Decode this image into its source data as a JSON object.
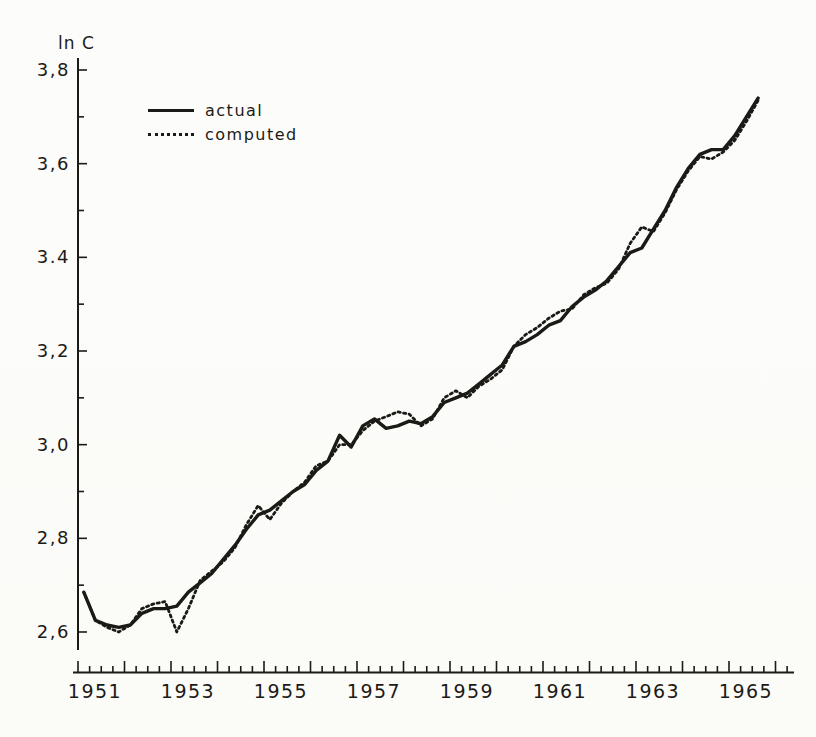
{
  "figure": {
    "background": "#fbfbf8",
    "ink": "#1c1a17"
  },
  "legend": {
    "items": [
      {
        "label": "actual",
        "style": "solid"
      },
      {
        "label": "computed",
        "style": "dotted"
      }
    ]
  },
  "chart_data": {
    "type": "line",
    "title": "",
    "xlabel": "",
    "ylabel": "ln C",
    "grid": false,
    "legend_position": "upper-left-inside",
    "xlim": [
      1950.9,
      1966.4
    ],
    "ylim": [
      2.56,
      3.83
    ],
    "x_start": 1951.125,
    "x_step": 0.25,
    "x_unit": "quarter",
    "x_label_years": [
      1951,
      1953,
      1955,
      1957,
      1959,
      1961,
      1963,
      1965
    ],
    "y_ticks_major": [
      2.6,
      2.8,
      3.0,
      3.2,
      3.4,
      3.6,
      3.8
    ],
    "y_tick_labels": [
      "2,6",
      "2,8",
      "3,0",
      "3,2",
      "3.4",
      "3,6",
      "3,8"
    ],
    "y_minor_step": 0.1,
    "series": [
      {
        "name": "actual",
        "style": "solid",
        "values": [
          2.685,
          2.625,
          2.615,
          2.61,
          2.615,
          2.64,
          2.65,
          2.65,
          2.655,
          2.685,
          2.705,
          2.725,
          2.755,
          2.785,
          2.82,
          2.85,
          2.86,
          2.88,
          2.9,
          2.915,
          2.945,
          2.965,
          3.02,
          2.995,
          3.04,
          3.055,
          3.035,
          3.04,
          3.05,
          3.045,
          3.06,
          3.09,
          3.1,
          3.11,
          3.13,
          3.15,
          3.17,
          3.21,
          3.22,
          3.235,
          3.255,
          3.265,
          3.295,
          3.315,
          3.33,
          3.35,
          3.38,
          3.41,
          3.42,
          3.46,
          3.5,
          3.55,
          3.59,
          3.62,
          3.63,
          3.63,
          3.66,
          3.7,
          3.74
        ]
      },
      {
        "name": "computed",
        "style": "dotted",
        "values": [
          2.685,
          2.625,
          2.61,
          2.6,
          2.615,
          2.65,
          2.66,
          2.665,
          2.6,
          2.65,
          2.71,
          2.73,
          2.75,
          2.78,
          2.83,
          2.87,
          2.84,
          2.875,
          2.9,
          2.92,
          2.955,
          2.965,
          3.0,
          3.0,
          3.03,
          3.05,
          3.06,
          3.07,
          3.065,
          3.04,
          3.055,
          3.1,
          3.115,
          3.1,
          3.125,
          3.14,
          3.16,
          3.21,
          3.235,
          3.25,
          3.27,
          3.285,
          3.29,
          3.32,
          3.335,
          3.345,
          3.375,
          3.43,
          3.465,
          3.455,
          3.495,
          3.545,
          3.585,
          3.615,
          3.61,
          3.625,
          3.65,
          3.69,
          3.735
        ]
      }
    ]
  }
}
